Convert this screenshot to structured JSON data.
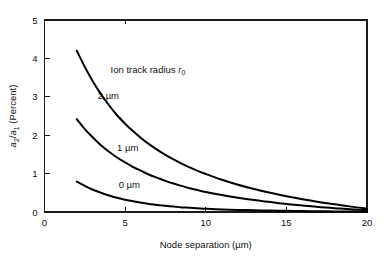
{
  "chart_data": {
    "type": "line",
    "title": "",
    "xlabel": "Node separation (µm)",
    "ylabel": "a2/a1 (Percent)",
    "ylabel_parts": {
      "num_base": "a",
      "num_sub": "2",
      "slash": "/",
      "den_base": "a",
      "den_sub": "1",
      "unit": " (Percent)"
    },
    "xlim": [
      0,
      20
    ],
    "ylim": [
      0,
      5
    ],
    "xticks": [
      0,
      5,
      10,
      15,
      20
    ],
    "yticks": [
      0,
      1,
      2,
      3,
      4,
      5
    ],
    "xtick_labels": [
      "0",
      "5",
      "10",
      "15",
      "20"
    ],
    "ytick_labels": [
      "0",
      "1",
      "2",
      "3",
      "4",
      "5"
    ],
    "grid": false,
    "legend_position": "inline-curve-labels",
    "annotation": "Ion track radius r0",
    "annotation_parts": {
      "text": "Ion track radius ",
      "symbol": "r",
      "symbol_sub": "0"
    },
    "line_color": "#000000",
    "axis_color": "#1a1a1a",
    "background": "#ffffff",
    "series": [
      {
        "name": "2 µm",
        "label": "2 µm",
        "label_x": 3.3,
        "label_y": 2.95,
        "x": [
          2.0,
          2.5,
          3.0,
          3.5,
          4.0,
          4.5,
          5.0,
          5.5,
          6.0,
          6.5,
          7.0,
          7.5,
          8.0,
          8.5,
          9.0,
          9.5,
          10.0,
          11.0,
          12.0,
          13.0,
          14.0,
          15.0,
          16.0,
          17.0,
          18.0,
          19.0,
          20.0
        ],
        "y": [
          4.2,
          3.78,
          3.4,
          3.07,
          2.78,
          2.52,
          2.3,
          2.1,
          1.92,
          1.76,
          1.62,
          1.49,
          1.37,
          1.26,
          1.16,
          1.07,
          0.99,
          0.84,
          0.71,
          0.6,
          0.5,
          0.41,
          0.33,
          0.26,
          0.2,
          0.14,
          0.09
        ]
      },
      {
        "name": "1 µm",
        "label": "1 µm",
        "label_x": 4.5,
        "label_y": 1.6,
        "x": [
          2.0,
          2.5,
          3.0,
          3.5,
          4.0,
          4.5,
          5.0,
          5.5,
          6.0,
          6.5,
          7.0,
          7.5,
          8.0,
          8.5,
          9.0,
          9.5,
          10.0,
          11.0,
          12.0,
          13.0,
          14.0,
          15.0,
          16.0,
          17.0,
          18.0,
          19.0,
          20.0
        ],
        "y": [
          2.42,
          2.16,
          1.94,
          1.74,
          1.57,
          1.42,
          1.29,
          1.17,
          1.07,
          0.97,
          0.89,
          0.81,
          0.74,
          0.68,
          0.62,
          0.57,
          0.52,
          0.44,
          0.37,
          0.31,
          0.26,
          0.21,
          0.17,
          0.13,
          0.1,
          0.07,
          0.05
        ]
      },
      {
        "name": "0 µm",
        "label": "0 µm",
        "label_x": 4.6,
        "label_y": 0.62,
        "x": [
          2.0,
          2.5,
          3.0,
          3.5,
          4.0,
          4.5,
          5.0,
          5.5,
          6.0,
          6.5,
          7.0,
          7.5,
          8.0,
          8.5,
          9.0,
          9.5,
          10.0,
          11.0,
          12.0,
          13.0,
          14.0,
          15.0,
          16.0,
          17.0,
          18.0,
          19.0,
          20.0
        ],
        "y": [
          0.79,
          0.68,
          0.58,
          0.5,
          0.43,
          0.37,
          0.32,
          0.28,
          0.24,
          0.21,
          0.18,
          0.16,
          0.14,
          0.12,
          0.11,
          0.095,
          0.085,
          0.068,
          0.055,
          0.045,
          0.037,
          0.03,
          0.025,
          0.02,
          0.016,
          0.013,
          0.01
        ]
      }
    ]
  }
}
